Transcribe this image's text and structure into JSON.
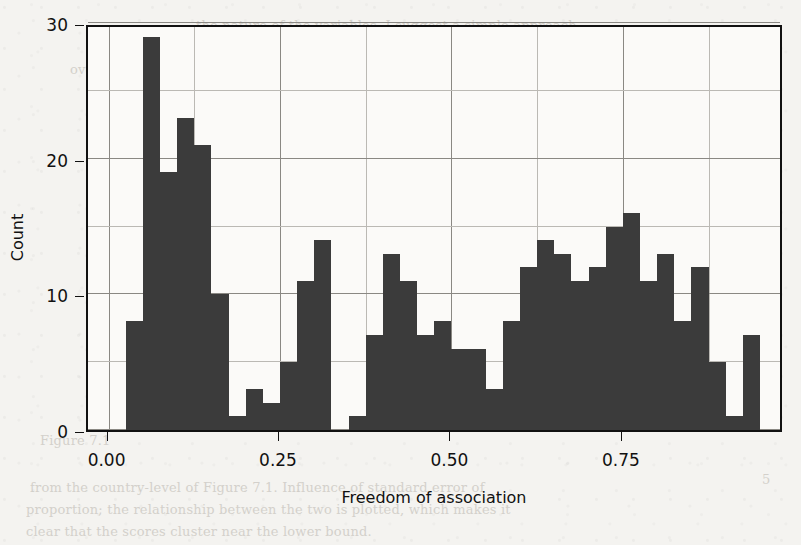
{
  "figure": {
    "background_color": "#f4f3f0",
    "bar_color": "#3b3b3b",
    "axis_color": "#111111",
    "grid_color": "#9c9a95"
  },
  "axes": {
    "x": {
      "label": "Freedom of association",
      "tick_labels": [
        "0.00",
        "0.25",
        "0.50",
        "0.75"
      ],
      "tick_values": [
        0.0,
        0.25,
        0.5,
        0.75
      ],
      "minor_grid_step": 0.125,
      "range": [
        -0.03,
        0.985
      ]
    },
    "y": {
      "label": "Count",
      "tick_labels": [
        "0",
        "10",
        "20",
        "30"
      ],
      "tick_values": [
        0,
        10,
        20,
        30
      ],
      "minor_grid_step": 5,
      "range": [
        0,
        30
      ]
    }
  },
  "chart_data": {
    "type": "bar",
    "title": "",
    "xlabel": "Freedom of association",
    "ylabel": "Count",
    "xlim": [
      -0.03,
      0.985
    ],
    "ylim": [
      0,
      30
    ],
    "grid": true,
    "legend": null,
    "bin_width": 0.025,
    "bin_starts": [
      0.025,
      0.05,
      0.075,
      0.1,
      0.125,
      0.15,
      0.175,
      0.2,
      0.225,
      0.25,
      0.275,
      0.3,
      0.325,
      0.35,
      0.375,
      0.4,
      0.425,
      0.45,
      0.475,
      0.5,
      0.525,
      0.55,
      0.575,
      0.6,
      0.625,
      0.65,
      0.675,
      0.7,
      0.725,
      0.75,
      0.775,
      0.8,
      0.825,
      0.85,
      0.875,
      0.9,
      0.925
    ],
    "categories": [
      "0.025",
      "0.050",
      "0.075",
      "0.100",
      "0.125",
      "0.150",
      "0.175",
      "0.200",
      "0.225",
      "0.250",
      "0.275",
      "0.300",
      "0.325",
      "0.350",
      "0.375",
      "0.400",
      "0.425",
      "0.450",
      "0.475",
      "0.500",
      "0.525",
      "0.550",
      "0.575",
      "0.600",
      "0.625",
      "0.650",
      "0.675",
      "0.700",
      "0.725",
      "0.750",
      "0.775",
      "0.800",
      "0.825",
      "0.850",
      "0.875",
      "0.900",
      "0.925"
    ],
    "values": [
      8,
      29,
      19,
      23,
      21,
      10,
      1,
      3,
      2,
      5,
      11,
      14,
      0,
      1,
      7,
      13,
      11,
      7,
      8,
      6,
      6,
      3,
      8,
      12,
      14,
      13,
      11,
      12,
      15,
      16,
      11,
      13,
      8,
      12,
      5,
      1,
      7
    ]
  },
  "page_background_text": [
    {
      "text": "the nature of the variables. I suggest a simple approach",
      "x": 196,
      "y": 18
    },
    {
      "text": "which allows the inclusion of country-level variables without",
      "x": 86,
      "y": 40
    },
    {
      "text": "overstating their precision. This procedure is illustrated in the first",
      "x": 70,
      "y": 62
    },
    {
      "text": "of the chapter's examples, to which we now turn.",
      "x": 100,
      "y": 84
    },
    {
      "text": "explain the effects of country-level factors upon",
      "x": 210,
      "y": 106
    },
    {
      "text": "The Model",
      "x": 352,
      "y": 128
    },
    {
      "text": "In this section we measure the relationship between freedom of",
      "x": 178,
      "y": 150
    },
    {
      "text": "association and union density across a sample of countries and",
      "x": 188,
      "y": 172
    },
    {
      "text": "years, using a multilevel framework to keep uncertainty honest.",
      "x": 206,
      "y": 194
    },
    {
      "text": "The sample distribution of the key covariate appears below.",
      "x": 140,
      "y": 216
    },
    {
      "text": "is plotted in Figure 7.1, which makes clear that the scores",
      "x": 120,
      "y": 238
    },
    {
      "text": "cluster at the low end and then spread broadly",
      "x": 160,
      "y": 260
    },
    {
      "text": "Figure 7.1",
      "x": 40,
      "y": 433
    },
    {
      "text": "from the country-level of Figure 7.1. Influence of standard error of",
      "x": 30,
      "y": 480
    },
    {
      "text": "proportion; the relationship between the two is plotted, which makes it",
      "x": 26,
      "y": 502
    },
    {
      "text": "clear that the scores cluster near the lower bound.",
      "x": 26,
      "y": 524
    },
    {
      "text": "5",
      "x": 762,
      "y": 472
    }
  ]
}
